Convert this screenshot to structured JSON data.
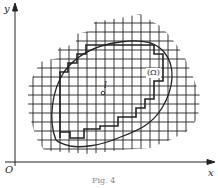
{
  "figure": {
    "caption": "Fig. 4",
    "axes": {
      "x_label": "x",
      "y_label": "y",
      "origin_label": "O"
    },
    "region_label": "(Ω)",
    "point_label": "l",
    "grid": {
      "spacing_px": 9,
      "description": "square mesh covering an irregular region containing the domain Ω"
    },
    "colors": {
      "ink": "#222222",
      "background": "#ffffff"
    }
  }
}
